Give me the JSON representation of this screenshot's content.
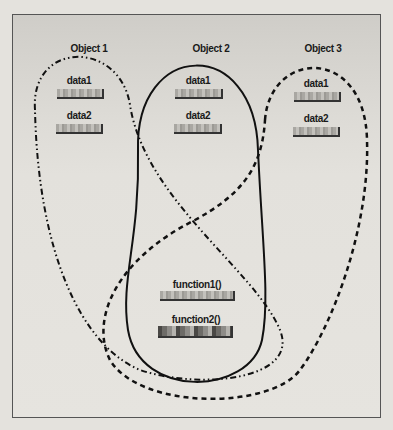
{
  "diagram": {
    "objects": [
      {
        "name": "Object 1",
        "line_style": "dash-dot-dot",
        "members": [
          "data1",
          "data2",
          "function1()",
          "function2()"
        ]
      },
      {
        "name": "Object 2",
        "line_style": "solid",
        "members": [
          "data1",
          "data2",
          "function1()",
          "function2()"
        ]
      },
      {
        "name": "Object 3",
        "line_style": "dashed",
        "members": [
          "data1",
          "data2",
          "function1()",
          "function2()"
        ]
      }
    ],
    "data_labels": {
      "obj1_data1": "data1",
      "obj1_data2": "data2",
      "obj2_data1": "data1",
      "obj2_data2": "data2",
      "obj3_data1": "data1",
      "obj3_data2": "data2"
    },
    "shared_functions": {
      "function1": "function1()",
      "function2": "function2()"
    },
    "colors": {
      "line": "#111111",
      "frame": "#555555",
      "background": "#e4e2dd"
    }
  }
}
